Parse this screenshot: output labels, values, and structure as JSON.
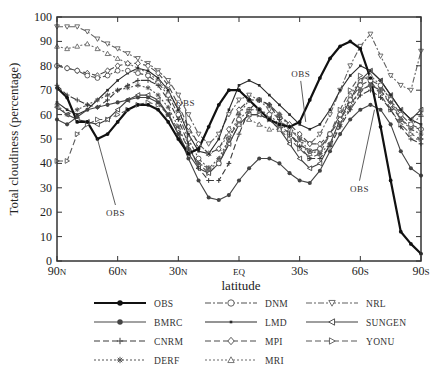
{
  "chart_data": {
    "type": "line",
    "title": "",
    "xlabel": "latitude",
    "ylabel": "Total cloudiness (percentage)",
    "ylim": [
      0,
      100
    ],
    "yticks": [
      0,
      10,
      20,
      30,
      40,
      50,
      60,
      70,
      80,
      90,
      100
    ],
    "xlim": [
      90,
      -90
    ],
    "xticks": [
      {
        "value": 90,
        "label": "90N"
      },
      {
        "value": 60,
        "label": "60N"
      },
      {
        "value": 30,
        "label": "30N"
      },
      {
        "value": 0,
        "label": "EQ"
      },
      {
        "value": -30,
        "label": "30S"
      },
      {
        "value": -60,
        "label": "60S"
      },
      {
        "value": -90,
        "label": "90S"
      }
    ],
    "grid": false,
    "legend_position": "bottom",
    "x": [
      90,
      85,
      80,
      75,
      70,
      65,
      60,
      55,
      50,
      45,
      40,
      35,
      30,
      25,
      20,
      15,
      10,
      5,
      0,
      -5,
      -10,
      -15,
      -20,
      -25,
      -30,
      -35,
      -40,
      -45,
      -50,
      -55,
      -60,
      -65,
      -70,
      -75,
      -80,
      -85,
      -90
    ],
    "series": [
      {
        "name": "OBS",
        "style": "solid-bold",
        "marker": "dot",
        "values": [
          71,
          67,
          57,
          57,
          50,
          52,
          57,
          62,
          64,
          64,
          62,
          57,
          50,
          44,
          46,
          55,
          64,
          70,
          70,
          66,
          62,
          58,
          56,
          55,
          57,
          66,
          75,
          83,
          88,
          90,
          87,
          75,
          55,
          33,
          12,
          7,
          3
        ]
      },
      {
        "name": "BMRC",
        "style": "solid",
        "marker": "dot",
        "values": [
          58,
          56,
          59,
          62,
          63,
          64,
          65,
          66,
          67,
          67,
          65,
          60,
          52,
          42,
          33,
          26,
          25,
          27,
          33,
          38,
          42,
          42,
          40,
          36,
          33,
          32,
          37,
          45,
          52,
          58,
          62,
          64,
          62,
          56,
          45,
          38,
          35
        ]
      },
      {
        "name": "CNRM",
        "style": "dash",
        "marker": "plus",
        "values": [
          72,
          68,
          66,
          64,
          63,
          66,
          70,
          72,
          74,
          74,
          72,
          66,
          58,
          48,
          38,
          33,
          33,
          40,
          52,
          62,
          66,
          64,
          58,
          52,
          47,
          42,
          42,
          47,
          55,
          62,
          68,
          70,
          67,
          62,
          55,
          50,
          48
        ]
      },
      {
        "name": "DERF",
        "style": "dot",
        "marker": "star",
        "values": [
          64,
          60,
          62,
          64,
          66,
          68,
          70,
          71,
          72,
          71,
          68,
          63,
          55,
          46,
          40,
          38,
          42,
          50,
          60,
          66,
          66,
          64,
          60,
          55,
          50,
          45,
          44,
          48,
          56,
          63,
          70,
          72,
          70,
          65,
          58,
          54,
          52
        ]
      },
      {
        "name": "DNM",
        "style": "dashdot",
        "marker": "circle-open",
        "values": [
          80,
          79,
          78,
          76,
          75,
          76,
          78,
          78,
          77,
          76,
          73,
          68,
          60,
          50,
          42,
          38,
          40,
          50,
          58,
          62,
          62,
          60,
          56,
          52,
          48,
          45,
          46,
          52,
          60,
          66,
          72,
          74,
          72,
          66,
          60,
          56,
          54
        ]
      },
      {
        "name": "LMD",
        "style": "solid",
        "marker": "square-small",
        "values": [
          65,
          62,
          60,
          62,
          66,
          70,
          74,
          77,
          79,
          78,
          75,
          70,
          62,
          52,
          45,
          44,
          50,
          62,
          72,
          74,
          72,
          68,
          64,
          60,
          56,
          54,
          56,
          62,
          70,
          76,
          80,
          78,
          74,
          68,
          62,
          58,
          56
        ]
      },
      {
        "name": "MPI",
        "style": "dash",
        "marker": "diamond-open",
        "values": [
          80,
          79,
          78,
          77,
          76,
          78,
          80,
          81,
          81,
          80,
          77,
          72,
          64,
          55,
          48,
          44,
          46,
          54,
          62,
          66,
          66,
          64,
          60,
          56,
          52,
          48,
          48,
          52,
          58,
          64,
          70,
          72,
          70,
          64,
          58,
          55,
          54
        ]
      },
      {
        "name": "MRI",
        "style": "dot",
        "marker": "triangle-up-open",
        "values": [
          88,
          87,
          88,
          89,
          87,
          85,
          83,
          81,
          79,
          77,
          74,
          69,
          62,
          54,
          48,
          44,
          46,
          52,
          56,
          58,
          56,
          54,
          54,
          52,
          48,
          44,
          46,
          52,
          60,
          68,
          74,
          76,
          72,
          66,
          58,
          55,
          60
        ]
      },
      {
        "name": "NRL",
        "style": "dashdot",
        "marker": "triangle-down-open",
        "values": [
          96,
          96,
          96,
          94,
          91,
          89,
          87,
          85,
          83,
          81,
          78,
          74,
          68,
          60,
          52,
          48,
          52,
          60,
          66,
          68,
          66,
          62,
          58,
          54,
          50,
          48,
          52,
          60,
          70,
          80,
          88,
          93,
          84,
          76,
          72,
          70,
          86
        ]
      },
      {
        "name": "SUNGEN",
        "style": "solid",
        "marker": "triangle-left-open",
        "values": [
          63,
          60,
          58,
          57,
          56,
          58,
          62,
          66,
          68,
          68,
          66,
          60,
          52,
          44,
          38,
          36,
          40,
          48,
          56,
          60,
          60,
          58,
          54,
          48,
          42,
          38,
          40,
          48,
          58,
          66,
          74,
          78,
          74,
          68,
          62,
          58,
          62
        ]
      },
      {
        "name": "YONU",
        "style": "dash",
        "marker": "triangle-right-open",
        "values": [
          41,
          41,
          52,
          56,
          58,
          58,
          60,
          62,
          64,
          65,
          64,
          60,
          54,
          46,
          40,
          36,
          40,
          48,
          56,
          60,
          60,
          58,
          54,
          50,
          46,
          42,
          44,
          52,
          62,
          70,
          76,
          74,
          68,
          62,
          56,
          52,
          50
        ]
      }
    ],
    "annotations": [
      {
        "text": "OBS",
        "at_lat": 70,
        "at_value": 50
      },
      {
        "text": "OBS",
        "at_lat": 25,
        "at_value": 45
      },
      {
        "text": "OBS",
        "at_lat": -33,
        "at_value": 57
      },
      {
        "text": "OBS",
        "at_lat": -67,
        "at_value": 62
      }
    ]
  }
}
